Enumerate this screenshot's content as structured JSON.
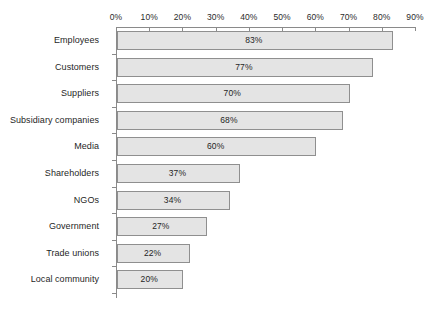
{
  "chart_data": {
    "type": "bar",
    "orientation": "horizontal",
    "title": "",
    "xlabel": "",
    "ylabel": "",
    "xlim": [
      0,
      90
    ],
    "grid": false,
    "legend": false,
    "axis_position": "top",
    "tick_labels": [
      "0%",
      "10%",
      "20%",
      "30%",
      "40%",
      "50%",
      "60%",
      "70%",
      "80%",
      "90%"
    ],
    "tick_values": [
      0,
      10,
      20,
      30,
      40,
      50,
      60,
      70,
      80,
      90
    ],
    "categories": [
      "Employees",
      "Customers",
      "Suppliers",
      "Subsidiary companies",
      "Media",
      "Shareholders",
      "NGOs",
      "Government",
      "Trade unions",
      "Local community"
    ],
    "values": [
      83,
      77,
      70,
      68,
      60,
      37,
      34,
      27,
      22,
      20
    ],
    "value_labels": [
      "83%",
      "77%",
      "70%",
      "68%",
      "60%",
      "37%",
      "34%",
      "27%",
      "22%",
      "20%"
    ],
    "colors": {
      "bar_fill": "#e4e4e4",
      "bar_border": "#8f8f8f",
      "axis": "#8a8a8a",
      "text": "#1f1f1f",
      "background": "#ffffff"
    }
  }
}
